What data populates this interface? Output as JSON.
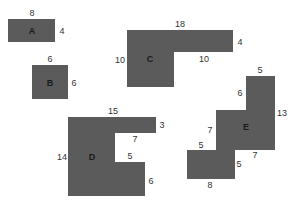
{
  "diagram": {
    "fill_color": "#5b5b5b",
    "shapes": [
      {
        "name": "A",
        "label_pos": [
          32,
          31
        ],
        "points": [
          [
            8,
            19
          ],
          [
            55,
            19
          ],
          [
            55,
            42
          ],
          [
            8,
            42
          ]
        ],
        "dimensions": [
          {
            "text": "8",
            "pos": [
              32,
              13
            ]
          },
          {
            "text": "4",
            "pos": [
              62,
              31
            ]
          }
        ]
      },
      {
        "name": "B",
        "label_pos": [
          50,
          83
        ],
        "points": [
          [
            32,
            65
          ],
          [
            68,
            65
          ],
          [
            68,
            99
          ],
          [
            32,
            99
          ]
        ],
        "dimensions": [
          {
            "text": "6",
            "pos": [
              50,
              59
            ]
          },
          {
            "text": "6",
            "pos": [
              74,
              83
            ]
          }
        ]
      },
      {
        "name": "C",
        "label_pos": [
          150,
          59
        ],
        "points": [
          [
            127,
            30
          ],
          [
            233,
            30
          ],
          [
            233,
            52
          ],
          [
            174,
            52
          ],
          [
            174,
            87
          ],
          [
            127,
            87
          ]
        ],
        "dimensions": [
          {
            "text": "18",
            "pos": [
              180,
              24
            ]
          },
          {
            "text": "4",
            "pos": [
              240,
              42
            ]
          },
          {
            "text": "10",
            "pos": [
              120,
              60
            ]
          },
          {
            "text": "10",
            "pos": [
              204,
              59
            ]
          }
        ]
      },
      {
        "name": "D",
        "label_pos": [
          92,
          157
        ],
        "points": [
          [
            68,
            117
          ],
          [
            156,
            117
          ],
          [
            156,
            133
          ],
          [
            115,
            133
          ],
          [
            115,
            162
          ],
          [
            145,
            162
          ],
          [
            145,
            196
          ],
          [
            68,
            196
          ]
        ],
        "dimensions": [
          {
            "text": "15",
            "pos": [
              113,
              111
            ]
          },
          {
            "text": "3",
            "pos": [
              162,
              125
            ]
          },
          {
            "text": "7",
            "pos": [
              135,
              139
            ]
          },
          {
            "text": "14",
            "pos": [
              62,
              157
            ]
          },
          {
            "text": "5",
            "pos": [
              130,
              156
            ]
          },
          {
            "text": "6",
            "pos": [
              151,
              181
            ]
          }
        ]
      },
      {
        "name": "E",
        "label_pos": [
          246,
          127
        ],
        "points": [
          [
            246,
            76
          ],
          [
            275,
            76
          ],
          [
            275,
            150
          ],
          [
            235,
            150
          ],
          [
            235,
            179
          ],
          [
            187,
            179
          ],
          [
            187,
            150
          ],
          [
            216,
            150
          ],
          [
            216,
            110
          ],
          [
            246,
            110
          ]
        ],
        "dimensions": [
          {
            "text": "5",
            "pos": [
              260,
              70
            ]
          },
          {
            "text": "6",
            "pos": [
              240,
              93
            ]
          },
          {
            "text": "13",
            "pos": [
              282,
              113
            ]
          },
          {
            "text": "7",
            "pos": [
              210,
              130
            ]
          },
          {
            "text": "5",
            "pos": [
              201,
              145
            ]
          },
          {
            "text": "7",
            "pos": [
              255,
              155
            ]
          },
          {
            "text": "5",
            "pos": [
              239,
              164
            ]
          },
          {
            "text": "8",
            "pos": [
              210,
              185
            ]
          }
        ]
      }
    ]
  }
}
